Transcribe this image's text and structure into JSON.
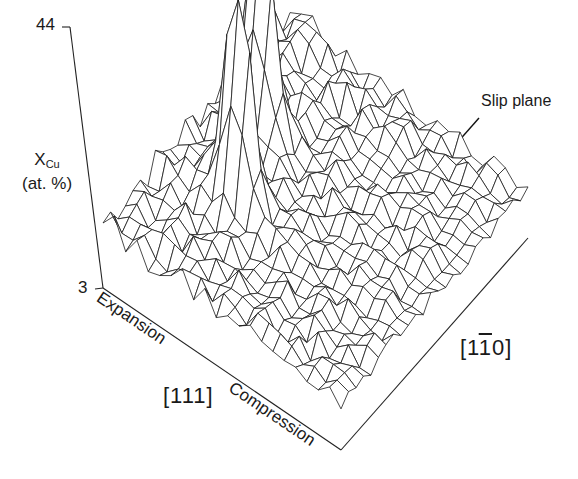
{
  "chart_data": {
    "type": "surface3d",
    "title": "",
    "zlabel_main": "X",
    "zlabel_sub": "Cu",
    "zlabel_unit": "(at. %)",
    "z_ticks": [
      "44",
      "3"
    ],
    "zlim": [
      3,
      44
    ],
    "x_axis": {
      "label": "[111]",
      "ends": [
        "Expansion",
        "Compression"
      ]
    },
    "y_axis": {
      "label_prefix": "[1",
      "label_bar": "1",
      "label_suffix": "0]"
    },
    "annotation": {
      "text": "Slip plane",
      "arrow": true
    },
    "grid": {
      "rows": 22,
      "cols": 26
    },
    "peaks": [
      {
        "name": "peak-1",
        "row": 6,
        "col": 9,
        "value": 40
      },
      {
        "name": "peak-2",
        "row": 4,
        "col": 15,
        "value": 41
      }
    ],
    "background_level_range": [
      5,
      14
    ],
    "style": {
      "line_color": "#1a1a1a",
      "background": "#ffffff"
    }
  },
  "labels": {
    "tick_top": "44",
    "tick_bottom": "3",
    "ylabel_main": "X",
    "ylabel_sub": "Cu",
    "ylabel_unit": "(at. %)",
    "slip_plane": "Slip plane",
    "expansion": "Expansion",
    "compression": "Compression",
    "miller_111": "[111]",
    "miller_110_pre": "[1",
    "miller_110_bar": "1",
    "miller_110_post": "0]"
  }
}
